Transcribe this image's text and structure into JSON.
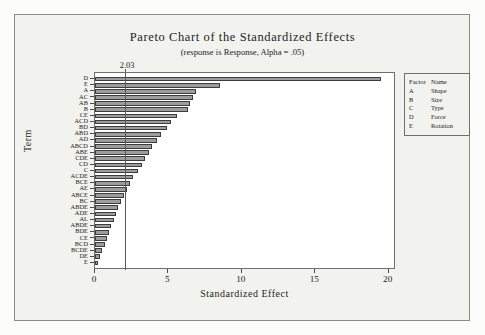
{
  "chart_data": {
    "type": "bar",
    "title": "Pareto Chart of the Standardized Effects",
    "subtitle": "(response is Response, Alpha = .05)",
    "xlabel": "Standardized Effect",
    "ylabel": "Term",
    "orientation": "horizontal",
    "xlim": [
      0,
      20.5
    ],
    "xticks": [
      0,
      5,
      10,
      15,
      20
    ],
    "xticklabels": [
      "0",
      "5",
      "10",
      "15",
      "20"
    ],
    "grid": false,
    "reference_line": {
      "value": 2.03,
      "label": "2.03"
    },
    "categories": [
      "D",
      "E",
      "A",
      "AC",
      "AB",
      "B",
      "CE",
      "ACD",
      "BD",
      "ABD",
      "AD",
      "ABCD",
      "ABE",
      "CDE",
      "CD",
      "C",
      "ACDE",
      "BCE",
      "AE",
      "ABCE",
      "BC",
      "ABDE",
      "ADE",
      "AL",
      "ABDE",
      "BDE",
      "CE",
      "BCD",
      "BCDE",
      "DE",
      "E"
    ],
    "values": [
      19.5,
      8.5,
      6.9,
      6.7,
      6.5,
      6.3,
      5.6,
      5.2,
      4.9,
      4.5,
      4.2,
      3.9,
      3.7,
      3.4,
      3.2,
      2.9,
      2.6,
      2.4,
      2.2,
      2.0,
      1.8,
      1.6,
      1.45,
      1.3,
      1.1,
      0.95,
      0.8,
      0.65,
      0.5,
      0.35,
      0.2
    ],
    "bar_color": "#9d9d9d",
    "bar_edge_color": "#3c3c3c"
  },
  "legend": {
    "headers": [
      "Factor",
      "Name"
    ],
    "rows": [
      {
        "factor": "A",
        "name": "Shape"
      },
      {
        "factor": "B",
        "name": "Size"
      },
      {
        "factor": "C",
        "name": "Type"
      },
      {
        "factor": "D",
        "name": "Force"
      },
      {
        "factor": "E",
        "name": "Rotation"
      }
    ]
  }
}
